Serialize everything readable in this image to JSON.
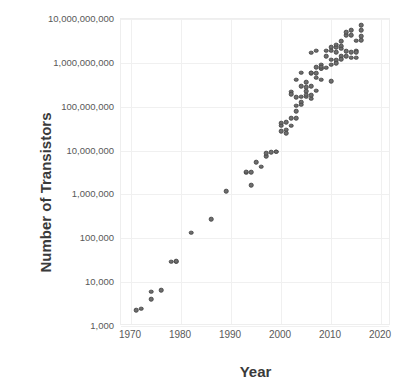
{
  "chart_data": {
    "type": "scatter",
    "title": "",
    "xlabel": "Year",
    "ylabel": "Number of Transistors",
    "xlim": [
      1968,
      2022
    ],
    "ylim": [
      1000,
      10000000000
    ],
    "yscale": "log",
    "grid": true,
    "legend": "none",
    "marker_color": "#6e6e6e",
    "marker_edge_color": "#4a4a4a",
    "gridline_color": "#f0f0f0",
    "axis_text_color": "#595959",
    "title_text_color": "#3a3a3a",
    "xticks": [
      "1970",
      "1980",
      "1990",
      "2000",
      "2010",
      "2020"
    ],
    "xtick_values": [
      1970,
      1980,
      1990,
      2000,
      2010,
      2020
    ],
    "yticks": [
      "1,000",
      "10,000",
      "100,000",
      "1,000,000",
      "10,000,000",
      "100,000,000",
      "1,000,000,000",
      "10,000,000,000"
    ],
    "ytick_values": [
      1000,
      10000,
      100000,
      1000000,
      10000000,
      100000000,
      1000000000,
      10000000000
    ],
    "points": [
      [
        1971,
        2300
      ],
      [
        1972,
        2500
      ],
      [
        1974,
        6000
      ],
      [
        1974,
        4100
      ],
      [
        1976,
        6500
      ],
      [
        1978,
        29000
      ],
      [
        1979,
        29000
      ],
      [
        1979,
        30000
      ],
      [
        1982,
        134000
      ],
      [
        1986,
        275000
      ],
      [
        1989,
        1180000
      ],
      [
        1993,
        3100000
      ],
      [
        1993,
        3300000
      ],
      [
        1994,
        3200000
      ],
      [
        1994,
        1600000
      ],
      [
        1995,
        5500000
      ],
      [
        1996,
        4300000
      ],
      [
        1997,
        7500000
      ],
      [
        1997,
        8800000
      ],
      [
        1998,
        9300000
      ],
      [
        1999,
        9500000
      ],
      [
        1999,
        9500000
      ],
      [
        2000,
        42000000
      ],
      [
        2000,
        28000000
      ],
      [
        2001,
        25000000
      ],
      [
        2001,
        45000000
      ],
      [
        2002,
        55000000
      ],
      [
        2002,
        37000000
      ],
      [
        2002,
        220000000
      ],
      [
        2003,
        105000000
      ],
      [
        2003,
        54000000
      ],
      [
        2003,
        410000000
      ],
      [
        2004,
        592000000
      ],
      [
        2004,
        125000000
      ],
      [
        2004,
        169000000
      ],
      [
        2004,
        291000000
      ],
      [
        2005,
        228000000
      ],
      [
        2005,
        169000000
      ],
      [
        2005,
        276000000
      ],
      [
        2006,
        151000000
      ],
      [
        2006,
        291000000
      ],
      [
        2006,
        582000000
      ],
      [
        2006,
        1700000000
      ],
      [
        2007,
        789000000
      ],
      [
        2007,
        463000000
      ],
      [
        2007,
        234000000
      ],
      [
        2007,
        1900000000
      ],
      [
        2008,
        758000000
      ],
      [
        2008,
        731000000
      ],
      [
        2008,
        904000000
      ],
      [
        2008,
        411000000
      ],
      [
        2009,
        774000000
      ],
      [
        2009,
        1900000000
      ],
      [
        2010,
        382000000
      ],
      [
        2010,
        1170000000
      ],
      [
        2010,
        2300000000
      ],
      [
        2010,
        904000000
      ],
      [
        2011,
        1160000000
      ],
      [
        2011,
        995000000
      ],
      [
        2011,
        2270000000
      ],
      [
        2011,
        2600000000
      ],
      [
        2011,
        1750000000
      ],
      [
        2012,
        1400000000
      ],
      [
        2012,
        2400000000
      ],
      [
        2012,
        3100000000
      ],
      [
        2012,
        1200000000
      ],
      [
        2013,
        1860000000
      ],
      [
        2013,
        4300000000
      ],
      [
        2013,
        5000000000
      ],
      [
        2013,
        1400000000
      ],
      [
        2014,
        1300000000
      ],
      [
        2014,
        1750000000
      ],
      [
        2014,
        5560000000
      ],
      [
        2014,
        4310000000
      ],
      [
        2015,
        1900000000
      ],
      [
        2015,
        3200000000
      ],
      [
        2015,
        1750000000
      ],
      [
        2015,
        1300000000
      ],
      [
        2016,
        7200000000
      ],
      [
        2016,
        3300000000
      ],
      [
        2016,
        5500000000
      ],
      [
        2016,
        4000000000
      ],
      [
        2003,
        166000000
      ],
      [
        2005,
        362000000
      ],
      [
        2007,
        582000000
      ],
      [
        2009,
        1400000000
      ],
      [
        2006,
        596000000
      ],
      [
        2002,
        191000000
      ],
      [
        2004,
        112000000
      ],
      [
        2005,
        188000000
      ],
      [
        2008,
        820000000
      ],
      [
        2010,
        1900000000
      ],
      [
        2012,
        2100000000
      ],
      [
        2001,
        30000000
      ],
      [
        2000,
        37000000
      ],
      [
        2003,
        80000000
      ],
      [
        2006,
        184000000
      ]
    ]
  }
}
